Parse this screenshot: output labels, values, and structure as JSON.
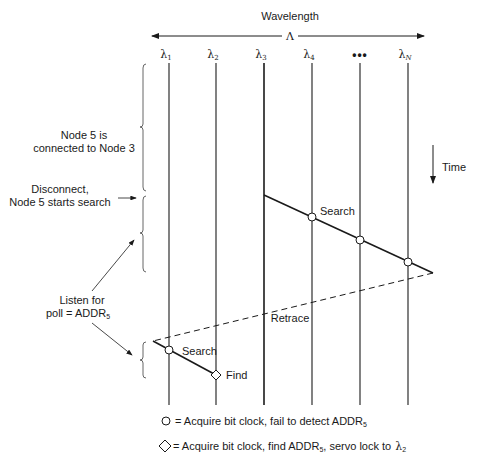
{
  "header": {
    "title": "Wavelength",
    "axis_symbol": "Λ"
  },
  "channels": [
    {
      "label": "λ",
      "sub": "1",
      "x": 169
    },
    {
      "label": "λ",
      "sub": "2",
      "x": 216
    },
    {
      "label": "λ",
      "sub": "3",
      "x": 264
    },
    {
      "label": "λ",
      "sub": "4",
      "x": 312
    },
    {
      "label": "•••",
      "sub": "",
      "x": 360
    },
    {
      "label": "λ",
      "sub": "N",
      "x": 408
    }
  ],
  "time_label": "Time",
  "annotations": {
    "connected_line1": "Node 5 is",
    "connected_line2": "connected to Node 3",
    "disconnect_line1": "Disconnect,",
    "disconnect_line2": "Node 5 starts search",
    "listen_line1": "Listen for",
    "listen_line2": "poll = ADDR",
    "listen_sub": "5",
    "search_top": "Search",
    "retrace": "Retrace",
    "search_bottom": "Search",
    "find": "Find"
  },
  "legend": {
    "circle_text": "= Acquire bit clock, fail to detect ADDR",
    "circle_sub": "5",
    "diamond_text_a": "= Acquire bit clock, find ADDR",
    "diamond_sub": "5",
    "diamond_text_b": ", servo lock to",
    "diamond_lambda": "λ",
    "diamond_lambda_sub": "2"
  },
  "colors": {
    "ink": "#1a1a1a",
    "background": "#ffffff"
  }
}
